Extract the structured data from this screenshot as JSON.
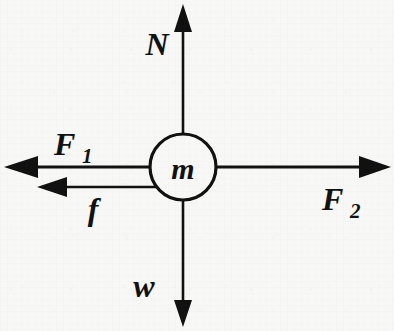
{
  "figure": {
    "kind": "free-body-diagram",
    "width": 394,
    "height": 331,
    "background_color": "#f7f7f6",
    "ink_color": "#111111"
  },
  "body": {
    "label": "m",
    "name": "mass",
    "center_x": 183,
    "center_y": 167,
    "radius": 33,
    "stroke_width": 3.2,
    "fill": "#f7f7f6"
  },
  "forces": [
    {
      "id": "normal",
      "label": "N",
      "label_x": 157,
      "label_y": 55,
      "direction": "up",
      "from_x": 183,
      "from_y": 134,
      "to_x": 183,
      "to_y": 4,
      "length": 130,
      "head_length": 28,
      "head_half_width": 9,
      "shaft_width": 2.6
    },
    {
      "id": "weight",
      "label": "w",
      "label_x": 144,
      "label_y": 297,
      "direction": "down",
      "from_x": 183,
      "from_y": 200,
      "to_x": 183,
      "to_y": 327,
      "length": 127,
      "head_length": 27,
      "head_half_width": 9,
      "shaft_width": 2.6
    },
    {
      "id": "applied-left",
      "label": "F",
      "subscript": "1",
      "label_x": 54,
      "label_y": 155,
      "sub_x": 82,
      "sub_y": 163,
      "direction": "left",
      "from_x": 150,
      "from_y": 167,
      "to_x": 4,
      "to_y": 167,
      "length": 146,
      "head_length": 34,
      "head_half_width": 11,
      "shaft_width": 3.0
    },
    {
      "id": "applied-right",
      "label": "F",
      "subscript": "2",
      "label_x": 322,
      "label_y": 210,
      "sub_x": 350,
      "sub_y": 218,
      "direction": "right",
      "from_x": 216,
      "from_y": 167,
      "to_x": 391,
      "to_y": 167,
      "length": 175,
      "head_length": 32,
      "head_half_width": 11,
      "shaft_width": 3.0
    },
    {
      "id": "friction",
      "label": "f",
      "label_x": 93,
      "label_y": 220,
      "direction": "left",
      "from_x": 164,
      "from_y": 187,
      "to_x": 37,
      "to_y": 187,
      "length": 127,
      "head_length": 30,
      "head_half_width": 10,
      "shaft_width": 2.6
    }
  ],
  "font_sizes": {
    "force_label": 32,
    "subscript": 21,
    "mass_label": 30
  }
}
